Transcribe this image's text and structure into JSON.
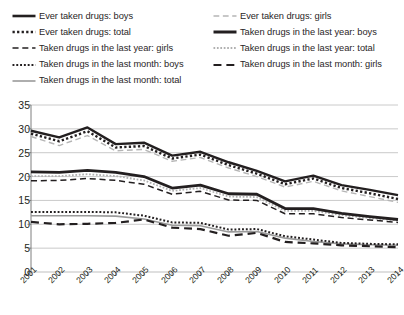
{
  "legend": {
    "columns": [
      {
        "items": [
          {
            "label": "Ever taken drugs: boys",
            "style": "solid",
            "color": "#231f20",
            "width": 2.6,
            "key": "ever_boys"
          },
          {
            "label": "Ever taken drugs: total",
            "style": "dotted",
            "color": "#231f20",
            "width": 2.4,
            "key": "ever_total"
          },
          {
            "label": "Taken drugs in the last year: girls",
            "style": "dashed",
            "color": "#231f20",
            "width": 1.5,
            "key": "year_girls"
          },
          {
            "label": "Taken drugs in the last month: boys",
            "style": "dotted",
            "color": "#231f20",
            "width": 2.0,
            "key": "month_boys"
          },
          {
            "label": "Taken drugs in the last month: total",
            "style": "solid",
            "color": "#9a9a9a",
            "width": 1.6,
            "key": "month_total"
          }
        ]
      },
      {
        "items": [
          {
            "label": "Ever taken drugs: girls",
            "style": "dashed",
            "color": "#b5b5b5",
            "width": 1.4,
            "key": "ever_girls"
          },
          {
            "label": "Taken drugs in the last year: boys",
            "style": "solid",
            "color": "#231f20",
            "width": 3.0,
            "key": "year_boys"
          },
          {
            "label": "Taken drugs in the last year: total",
            "style": "dotted",
            "color": "#b0b0b0",
            "width": 1.8,
            "key": "year_total"
          },
          {
            "label": "Taken drugs in the last month: girls",
            "style": "dashed",
            "color": "#231f20",
            "width": 2.2,
            "key": "month_girls"
          }
        ]
      }
    ]
  },
  "axes": {
    "y_ticks": [
      "0",
      "5",
      "10",
      "15",
      "20",
      "25",
      "30",
      "35"
    ],
    "x_ticks": [
      "2001",
      "2002",
      "2003",
      "2004",
      "2005",
      "2006",
      "2007",
      "2008",
      "2009",
      "2010",
      "2011",
      "2012",
      "2013",
      "2014"
    ]
  },
  "colors": {
    "ink": "#231f20",
    "grid": "#b8b8b8",
    "axis": "#6f6f6f",
    "light_gray": "#b5b5b5",
    "mid_gray": "#9a9a9a",
    "background": "#ffffff"
  },
  "chart_data": {
    "type": "line",
    "title": "",
    "xlabel": "",
    "ylabel": "",
    "ylim": [
      0,
      35
    ],
    "ytick_step": 5,
    "grid": true,
    "legend_position": "top",
    "x": [
      "2001",
      "2002",
      "2003",
      "2004",
      "2005",
      "2006",
      "2007",
      "2008",
      "2009",
      "2010",
      "2011",
      "2012",
      "2013",
      "2014"
    ],
    "series": [
      {
        "name": "Ever taken drugs: boys",
        "key": "ever_boys",
        "style": "solid",
        "color": "#231f20",
        "width": 2.4,
        "values": [
          29.6,
          28.2,
          30.3,
          26.8,
          27.1,
          24.4,
          25.2,
          23.0,
          21.2,
          19.0,
          20.2,
          18.2,
          17.2,
          16.1
        ]
      },
      {
        "name": "Ever taken drugs: total",
        "key": "ever_total",
        "style": "dotted",
        "color": "#231f20",
        "width": 2.4,
        "values": [
          29.0,
          27.4,
          29.5,
          26.1,
          26.4,
          23.8,
          24.6,
          22.4,
          20.6,
          18.4,
          19.6,
          17.6,
          16.5,
          15.3
        ]
      },
      {
        "name": "Ever taken drugs: girls",
        "key": "ever_girls",
        "style": "dashed",
        "color": "#b5b5b5",
        "width": 1.4,
        "values": [
          28.4,
          26.5,
          28.6,
          25.4,
          25.7,
          23.2,
          24.0,
          21.8,
          20.0,
          17.8,
          19.0,
          17.0,
          15.8,
          14.6
        ]
      },
      {
        "name": "Taken drugs in the last year: boys",
        "key": "year_boys",
        "style": "solid",
        "color": "#231f20",
        "width": 2.8,
        "values": [
          21.0,
          20.9,
          21.3,
          20.9,
          20.0,
          17.6,
          18.2,
          16.4,
          16.3,
          13.3,
          13.3,
          12.3,
          11.6,
          11.0
        ]
      },
      {
        "name": "Taken drugs in the last year: total",
        "key": "year_total",
        "style": "dotted",
        "color": "#b0b0b0",
        "width": 1.8,
        "values": [
          20.1,
          20.1,
          20.5,
          20.1,
          19.2,
          17.0,
          17.6,
          15.8,
          15.7,
          12.8,
          12.8,
          11.9,
          11.3,
          10.8
        ]
      },
      {
        "name": "Taken drugs in the last year: girls",
        "key": "year_girls",
        "style": "dashed",
        "color": "#231f20",
        "width": 1.5,
        "values": [
          19.1,
          19.2,
          19.6,
          19.2,
          18.4,
          16.3,
          16.9,
          15.1,
          15.0,
          12.2,
          12.2,
          11.4,
          10.9,
          10.4
        ]
      },
      {
        "name": "Taken drugs in the last month: boys",
        "key": "month_boys",
        "style": "dotted",
        "color": "#231f20",
        "width": 2.0,
        "values": [
          12.6,
          12.6,
          12.6,
          12.5,
          11.8,
          10.4,
          10.3,
          8.9,
          9.0,
          7.5,
          6.8,
          6.1,
          5.9,
          5.8
        ]
      },
      {
        "name": "Taken drugs in the last month: total",
        "key": "month_total",
        "style": "solid",
        "color": "#9a9a9a",
        "width": 1.6,
        "values": [
          11.8,
          11.8,
          11.8,
          11.7,
          11.1,
          9.8,
          9.7,
          8.4,
          8.5,
          7.1,
          6.4,
          5.9,
          5.7,
          5.6
        ]
      },
      {
        "name": "Taken drugs in the last month: girls",
        "key": "month_girls",
        "style": "dashed",
        "color": "#231f20",
        "width": 2.2,
        "values": [
          10.5,
          10.0,
          10.1,
          10.3,
          11.0,
          9.3,
          9.0,
          7.6,
          8.2,
          6.3,
          6.0,
          5.6,
          5.4,
          5.2
        ]
      }
    ]
  }
}
